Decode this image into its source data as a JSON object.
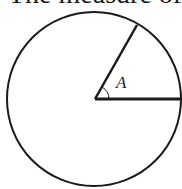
{
  "caption": "The measure of",
  "diagram": {
    "shape": "circle",
    "angle_label": "A",
    "stroke_color": "#1a1a1a",
    "background": "#ffffff"
  }
}
